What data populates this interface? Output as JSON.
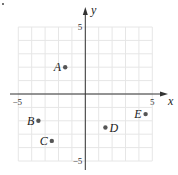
{
  "chart_data": {
    "type": "scatter",
    "title": "",
    "xlabel": "x",
    "ylabel": "y",
    "xlim": [
      -5,
      5
    ],
    "ylim": [
      -5,
      5
    ],
    "grid": true,
    "grid_step": 1,
    "tick_labels": {
      "x": [
        {
          "value": -5,
          "label": "−5"
        },
        {
          "value": 5,
          "label": "5"
        }
      ],
      "y": [
        {
          "value": 5,
          "label": "5"
        },
        {
          "value": -5,
          "label": "−5"
        }
      ]
    },
    "points": [
      {
        "label": "A",
        "x": -1.5,
        "y": 2,
        "label_side": "left"
      },
      {
        "label": "B",
        "x": -3.5,
        "y": -2,
        "label_side": "left"
      },
      {
        "label": "C",
        "x": -2.5,
        "y": -3.5,
        "label_side": "left"
      },
      {
        "label": "D",
        "x": 1.5,
        "y": -2.5,
        "label_side": "right"
      },
      {
        "label": "E",
        "x": 4.5,
        "y": -1.5,
        "label_side": "left"
      }
    ],
    "colors": {
      "axis": "#333333",
      "grid": "#e6e6e6",
      "point": "#555555"
    }
  }
}
